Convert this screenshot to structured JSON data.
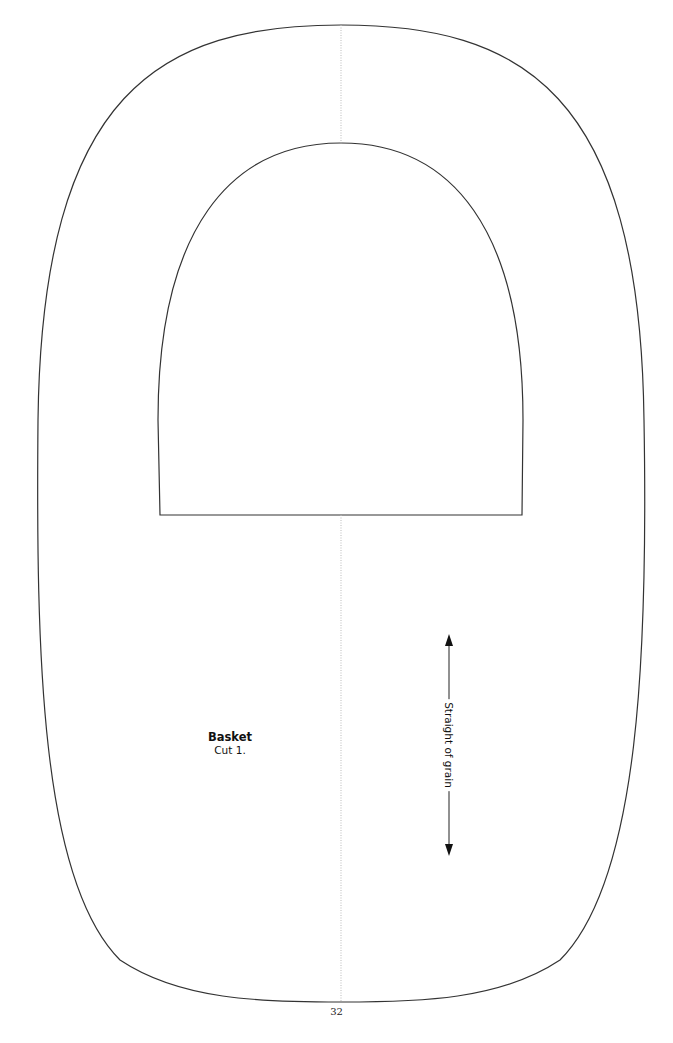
{
  "page": {
    "number": "32"
  },
  "pattern_piece": {
    "name": "Basket",
    "instruction": "Cut 1.",
    "grain_label": "Straight of grain"
  },
  "colors": {
    "outline": "#333333",
    "fold_line": "#bbbbbb",
    "background": "#ffffff"
  }
}
